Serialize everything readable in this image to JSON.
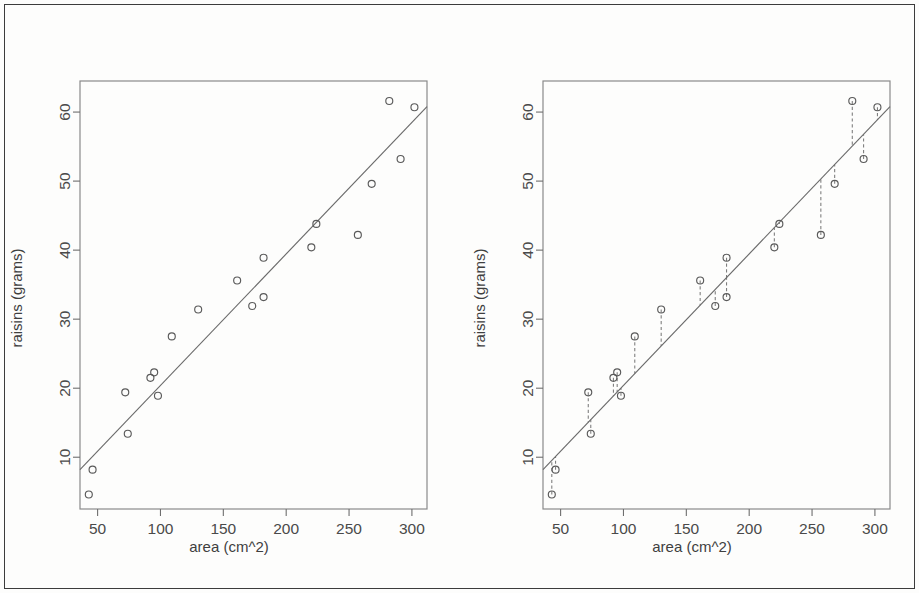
{
  "figure": {
    "panels": [
      {
        "id": "left",
        "name": "scatter-with-regression-line",
        "xlabel": "area (cm^2)",
        "ylabel": "raisins (grams)",
        "show_residuals": false
      },
      {
        "id": "right",
        "name": "scatter-with-residual-segments",
        "xlabel": "area (cm^2)",
        "ylabel": "raisins (grams)",
        "show_residuals": true
      }
    ]
  },
  "chart_data": [
    {
      "type": "scatter",
      "title": "",
      "xlabel": "area (cm^2)",
      "ylabel": "raisins (grams)",
      "xlim": [
        36,
        312
      ],
      "ylim": [
        2.5,
        64.5
      ],
      "xticks": [
        50,
        100,
        150,
        200,
        250,
        300
      ],
      "yticks": [
        10,
        20,
        30,
        40,
        50,
        60
      ],
      "grid": false,
      "legend": null,
      "series": [
        {
          "name": "raisins vs area",
          "marker": "open-circle",
          "x": [
            43,
            46,
            72,
            74,
            92,
            95,
            98,
            109,
            130,
            161,
            173,
            182,
            182,
            220,
            224,
            257,
            268,
            282,
            291,
            302
          ],
          "y": [
            4.6,
            8.2,
            19.4,
            13.4,
            21.5,
            22.3,
            18.9,
            27.5,
            31.4,
            35.6,
            31.9,
            33.2,
            38.9,
            40.4,
            43.8,
            42.2,
            49.6,
            61.6,
            53.2,
            60.7
          ]
        }
      ],
      "fit_line": {
        "name": "least-squares regression line",
        "intercept": 1.35,
        "slope": 0.1905,
        "x_start": 36,
        "x_end": 312
      }
    },
    {
      "type": "scatter",
      "title": "",
      "xlabel": "area (cm^2)",
      "ylabel": "raisins (grams)",
      "xlim": [
        36,
        312
      ],
      "ylim": [
        2.5,
        64.5
      ],
      "xticks": [
        50,
        100,
        150,
        200,
        250,
        300
      ],
      "yticks": [
        10,
        20,
        30,
        40,
        50,
        60
      ],
      "grid": false,
      "legend": null,
      "series": [
        {
          "name": "raisins vs area",
          "marker": "open-circle",
          "x": [
            43,
            46,
            72,
            74,
            92,
            95,
            98,
            109,
            130,
            161,
            173,
            182,
            182,
            220,
            224,
            257,
            268,
            282,
            291,
            302
          ],
          "y": [
            4.6,
            8.2,
            19.4,
            13.4,
            21.5,
            22.3,
            18.9,
            27.5,
            31.4,
            35.6,
            31.9,
            33.2,
            38.9,
            40.4,
            43.8,
            42.2,
            49.6,
            61.6,
            53.2,
            60.7
          ]
        }
      ],
      "fit_line": {
        "name": "least-squares regression line",
        "intercept": 1.35,
        "slope": 0.1905,
        "x_start": 36,
        "x_end": 312
      },
      "residual_segments": {
        "name": "residual dashed segments",
        "style": "dashed-vertical"
      }
    }
  ]
}
